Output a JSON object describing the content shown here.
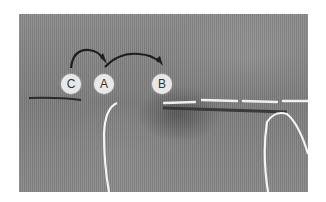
{
  "image": {
    "description": "Close-up photograph of gray woven fabric showing a hand-stitching technique with white thread",
    "labels": [
      {
        "id": "C",
        "text": "C"
      },
      {
        "id": "A",
        "text": "A"
      },
      {
        "id": "B",
        "text": "B"
      }
    ],
    "arrows": [
      {
        "from": "C",
        "to": "A"
      },
      {
        "from": "A",
        "to": "B"
      }
    ],
    "colors": {
      "fabric": "#858585",
      "thread": "#f2f2f2",
      "label_bg": "#e8e8e8",
      "label_text": "#333333",
      "arrow": "#1e1e1e"
    }
  }
}
